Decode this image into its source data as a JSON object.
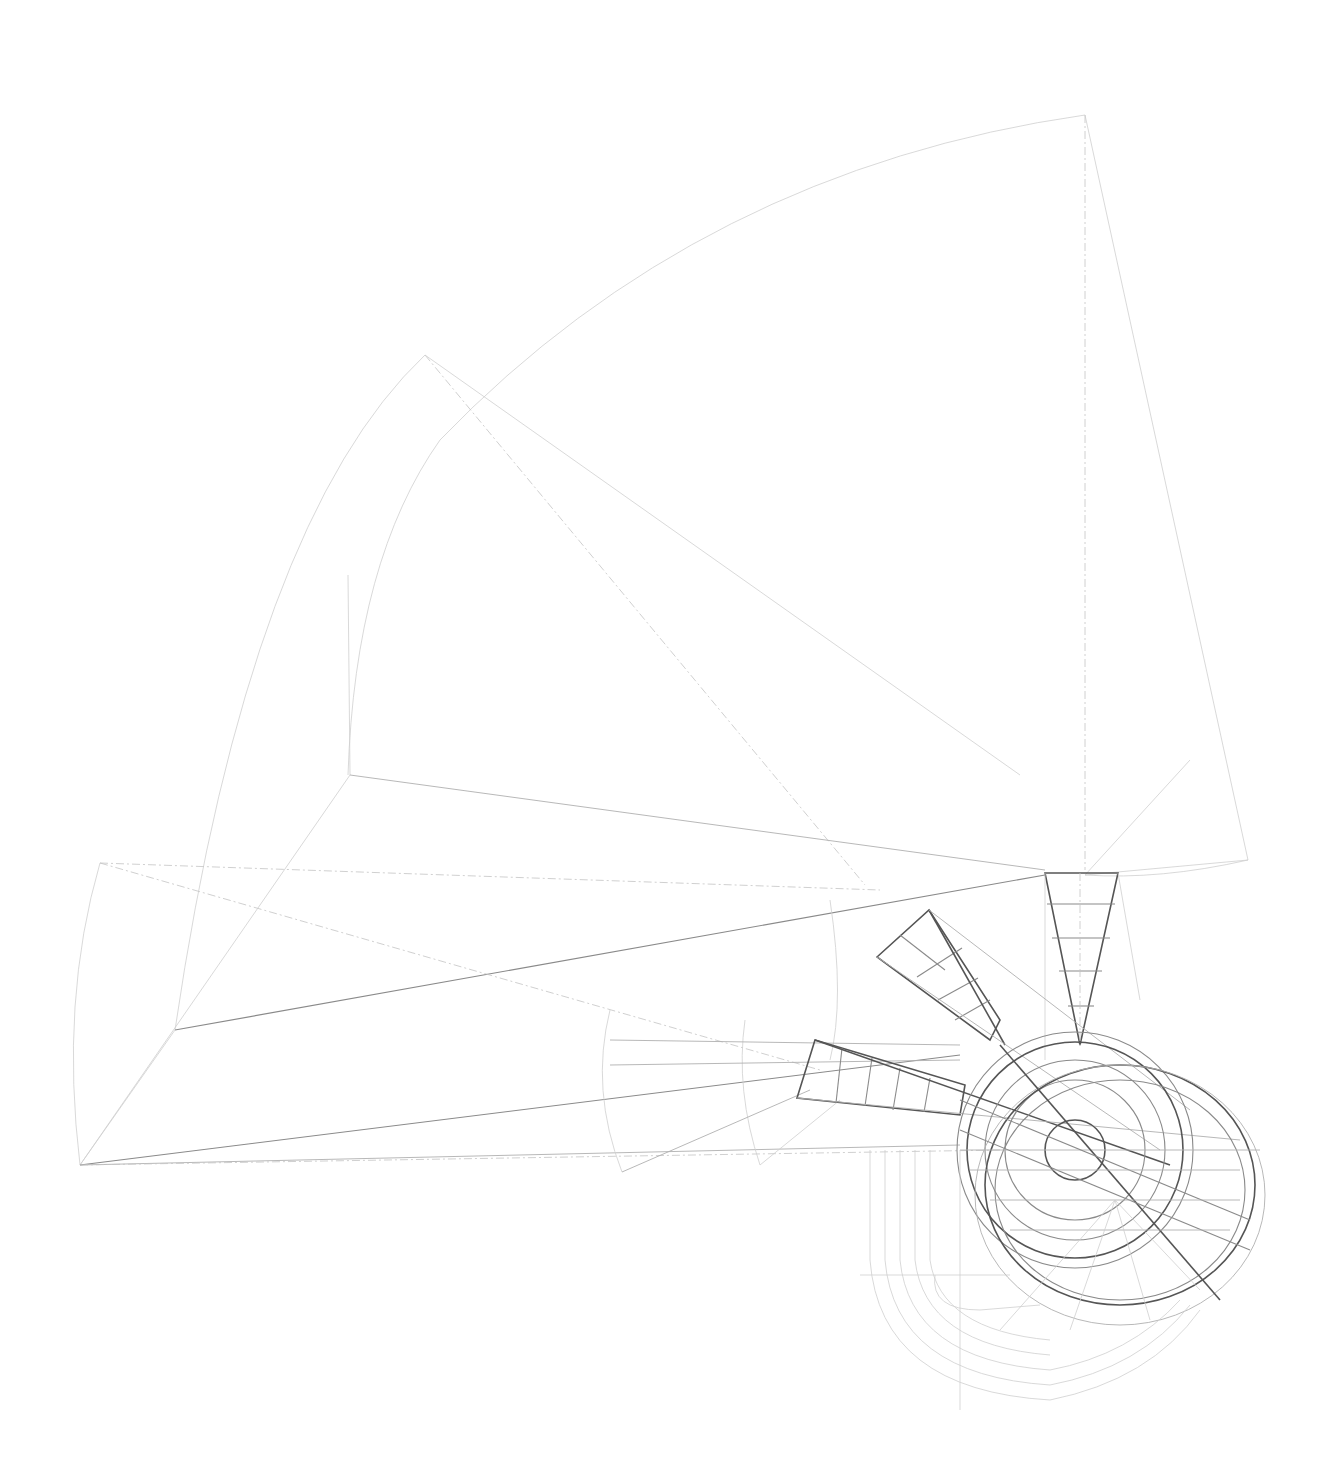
{
  "diagram": {
    "type": "geometric-construction-drawing",
    "colors": {
      "background": "#ffffff",
      "line_faint": "#cfcfcf",
      "line_mid": "#8a8a8a",
      "line_dark": "#555555"
    },
    "elements": {
      "large_sector": {
        "apex": [
          1085,
          115
        ],
        "label": ""
      },
      "middle_sector": {
        "apex": [
          425,
          355
        ],
        "label": ""
      },
      "left_sector": {
        "apex": [
          80,
          1165
        ],
        "label": ""
      },
      "vertical_frame": {
        "bays": 5
      },
      "diagonal_frame": {
        "bays": 4
      },
      "horizontal_frame": {
        "bays": 5
      },
      "focal_circle": {
        "center": [
          1075,
          1150
        ],
        "label": ""
      }
    }
  }
}
